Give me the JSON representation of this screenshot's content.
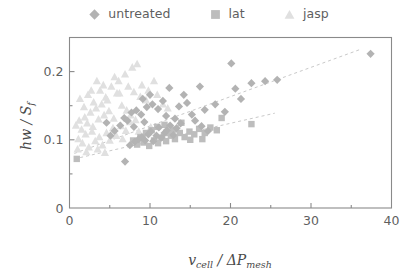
{
  "legend": {
    "entries": [
      {
        "label": "untreated",
        "marker": "diamond",
        "color": "#b3b3b3"
      },
      {
        "label": "lat",
        "marker": "square",
        "color": "#bdbdbd"
      },
      {
        "label": "jasp",
        "marker": "triangle",
        "color": "#e0e0e0"
      }
    ]
  },
  "axes": {
    "x_label_main": "v",
    "x_label_sub1": "cell",
    "x_label_slash": " / ",
    "x_label_delta": "ΔP",
    "x_label_sub2": "mesh",
    "y_label_main": "hw / S",
    "y_label_sub": "f",
    "x_ticklabels": [
      "0",
      "10",
      "20",
      "30",
      "40"
    ],
    "y_ticklabels": [
      "0",
      "0.1",
      "0.2"
    ]
  },
  "chart_data": {
    "type": "scatter",
    "title": "",
    "xlabel": "v_cell / ΔP_mesh",
    "ylabel": "hw / S_f",
    "xlim": [
      0,
      40
    ],
    "ylim": [
      0,
      0.25
    ],
    "xticks": [
      0,
      10,
      20,
      30,
      40
    ],
    "xminorticks": [
      5,
      15,
      25,
      35
    ],
    "yticks": [
      0,
      0.1,
      0.2
    ],
    "yminorticks": [
      0.05,
      0.15,
      0.25
    ],
    "grid": false,
    "legend_position": "above-plot",
    "series": [
      {
        "name": "untreated",
        "marker": "diamond",
        "color": "#b3b3b3",
        "points": [
          [
            6.9,
            0.068
          ],
          [
            7.5,
            0.092
          ],
          [
            8.1,
            0.097
          ],
          [
            8.6,
            0.101
          ],
          [
            9.0,
            0.104
          ],
          [
            9.4,
            0.099
          ],
          [
            9.8,
            0.108
          ],
          [
            10.1,
            0.112
          ],
          [
            10.4,
            0.098
          ],
          [
            10.8,
            0.106
          ],
          [
            11.1,
            0.118
          ],
          [
            11.4,
            0.103
          ],
          [
            11.8,
            0.11
          ],
          [
            12.1,
            0.114
          ],
          [
            12.5,
            0.121
          ],
          [
            12.9,
            0.107
          ],
          [
            13.3,
            0.117
          ],
          [
            13.8,
            0.124
          ],
          [
            6.3,
            0.121
          ],
          [
            6.8,
            0.132
          ],
          [
            7.2,
            0.128
          ],
          [
            7.7,
            0.14
          ],
          [
            8.3,
            0.143
          ],
          [
            8.9,
            0.137
          ],
          [
            9.6,
            0.148
          ],
          [
            10.3,
            0.152
          ],
          [
            11.0,
            0.145
          ],
          [
            9.1,
            0.16
          ],
          [
            10.0,
            0.166
          ],
          [
            11.6,
            0.157
          ],
          [
            12.4,
            0.176
          ],
          [
            13.6,
            0.149
          ],
          [
            14.6,
            0.154
          ],
          [
            15.6,
            0.128
          ],
          [
            16.4,
            0.12
          ],
          [
            17.2,
            0.113
          ],
          [
            15.2,
            0.137
          ],
          [
            16.8,
            0.144
          ],
          [
            18.1,
            0.152
          ],
          [
            19.3,
            0.141
          ],
          [
            20.6,
            0.175
          ],
          [
            21.3,
            0.16
          ],
          [
            20.1,
            0.212
          ],
          [
            22.6,
            0.183
          ],
          [
            24.3,
            0.186
          ],
          [
            25.8,
            0.188
          ],
          [
            16.2,
            0.178
          ],
          [
            14.2,
            0.166
          ],
          [
            37.4,
            0.226
          ],
          [
            5.6,
            0.113
          ],
          [
            5.1,
            0.106
          ],
          [
            4.6,
            0.125
          ],
          [
            8.0,
            0.119
          ],
          [
            9.3,
            0.126
          ],
          [
            12.0,
            0.135
          ],
          [
            13.1,
            0.131
          ]
        ]
      },
      {
        "name": "lat",
        "marker": "square",
        "color": "#bdbdbd",
        "points": [
          [
            0.9,
            0.072
          ],
          [
            8.4,
            0.093
          ],
          [
            9.2,
            0.096
          ],
          [
            9.9,
            0.091
          ],
          [
            10.5,
            0.099
          ],
          [
            11.0,
            0.095
          ],
          [
            11.5,
            0.103
          ],
          [
            12.0,
            0.098
          ],
          [
            12.6,
            0.106
          ],
          [
            13.1,
            0.101
          ],
          [
            13.7,
            0.11
          ],
          [
            14.3,
            0.104
          ],
          [
            14.9,
            0.112
          ],
          [
            15.5,
            0.108
          ],
          [
            16.1,
            0.116
          ],
          [
            16.8,
            0.11
          ],
          [
            17.5,
            0.118
          ],
          [
            18.3,
            0.114
          ],
          [
            10.9,
            0.119
          ],
          [
            11.8,
            0.122
          ],
          [
            12.9,
            0.115
          ],
          [
            13.9,
            0.125
          ],
          [
            18.9,
            0.132
          ],
          [
            22.6,
            0.123
          ],
          [
            9.5,
            0.11
          ],
          [
            10.2,
            0.114
          ],
          [
            8.8,
            0.104
          ],
          [
            12.3,
            0.11
          ],
          [
            15.0,
            0.1
          ],
          [
            16.5,
            0.101
          ],
          [
            7.9,
            0.099
          ]
        ]
      },
      {
        "name": "jasp",
        "marker": "triangle",
        "color": "#e0e0e0",
        "points": [
          [
            0.8,
            0.121
          ],
          [
            1.2,
            0.128
          ],
          [
            1.5,
            0.115
          ],
          [
            1.9,
            0.133
          ],
          [
            2.2,
            0.124
          ],
          [
            2.6,
            0.14
          ],
          [
            2.9,
            0.119
          ],
          [
            3.3,
            0.146
          ],
          [
            3.6,
            0.13
          ],
          [
            4.0,
            0.152
          ],
          [
            4.3,
            0.136
          ],
          [
            4.7,
            0.158
          ],
          [
            1.1,
            0.101
          ],
          [
            1.6,
            0.095
          ],
          [
            2.0,
            0.108
          ],
          [
            2.4,
            0.089
          ],
          [
            2.8,
            0.112
          ],
          [
            3.2,
            0.098
          ],
          [
            3.7,
            0.104
          ],
          [
            4.1,
            0.092
          ],
          [
            4.6,
            0.11
          ],
          [
            5.0,
            0.099
          ],
          [
            5.4,
            0.117
          ],
          [
            5.8,
            0.106
          ],
          [
            1.3,
            0.16
          ],
          [
            1.8,
            0.148
          ],
          [
            2.3,
            0.166
          ],
          [
            3.0,
            0.155
          ],
          [
            3.8,
            0.172
          ],
          [
            4.5,
            0.162
          ],
          [
            5.2,
            0.178
          ],
          [
            5.9,
            0.168
          ],
          [
            6.5,
            0.15
          ],
          [
            7.1,
            0.143
          ],
          [
            7.6,
            0.136
          ],
          [
            8.2,
            0.129
          ],
          [
            6.1,
            0.186
          ],
          [
            6.9,
            0.196
          ],
          [
            7.8,
            0.206
          ],
          [
            8.4,
            0.211
          ],
          [
            7.3,
            0.178
          ],
          [
            8.0,
            0.17
          ],
          [
            8.8,
            0.163
          ],
          [
            9.5,
            0.158
          ],
          [
            6.4,
            0.12
          ],
          [
            7.0,
            0.113
          ],
          [
            7.5,
            0.126
          ],
          [
            5.5,
            0.131
          ],
          [
            4.9,
            0.142
          ],
          [
            9.0,
            0.18
          ],
          [
            9.8,
            0.172
          ],
          [
            10.5,
            0.186
          ],
          [
            2.7,
            0.172
          ],
          [
            3.4,
            0.186
          ],
          [
            4.2,
            0.18
          ],
          [
            5.6,
            0.192
          ],
          [
            6.2,
            0.168
          ],
          [
            10.9,
            0.166
          ],
          [
            11.6,
            0.152
          ],
          [
            12.2,
            0.146
          ],
          [
            1.0,
            0.086
          ],
          [
            2.1,
            0.082
          ],
          [
            3.5,
            0.086
          ],
          [
            4.4,
            0.081
          ],
          [
            6.6,
            0.101
          ],
          [
            8.6,
            0.112
          ],
          [
            9.2,
            0.104
          ],
          [
            10.1,
            0.118
          ]
        ]
      }
    ],
    "trendlines": [
      {
        "name": "upper-trend",
        "x": [
          0.6,
          36.0
        ],
        "y": [
          0.08,
          0.232
        ],
        "style": "dashed",
        "color": "#c9c9c9"
      },
      {
        "name": "lower-trend",
        "x": [
          0.6,
          25.5
        ],
        "y": [
          0.072,
          0.139
        ],
        "style": "dashed",
        "color": "#c9c9c9"
      }
    ]
  }
}
